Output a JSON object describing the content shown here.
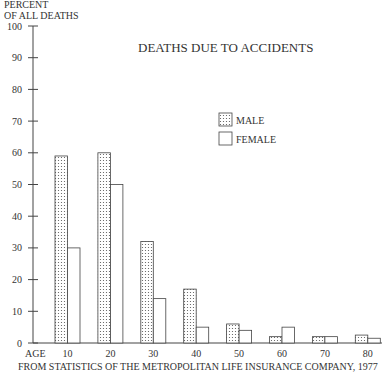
{
  "chart_data": {
    "type": "bar",
    "title": "DEATHS DUE TO ACCIDENTS",
    "ylabel_line1": "PERCENT",
    "ylabel_line2": "OF ALL DEATHS",
    "xlabel": "AGE",
    "source": "FROM STATISTICS OF THE METROPOLITAN LIFE INSURANCE COMPANY, 1977",
    "categories": [
      "10",
      "20",
      "30",
      "40",
      "50",
      "60",
      "70",
      "80"
    ],
    "series": [
      {
        "name": "MALE",
        "pattern": "dotted",
        "values": [
          59,
          60,
          32,
          17,
          6,
          2,
          2,
          2.5
        ]
      },
      {
        "name": "FEMALE",
        "pattern": "blank",
        "values": [
          30,
          50,
          14,
          5,
          4,
          5,
          2,
          1.5
        ]
      }
    ],
    "yticks": [
      0,
      10,
      20,
      30,
      40,
      50,
      60,
      70,
      80,
      90,
      100
    ],
    "ylim": [
      0,
      100
    ],
    "grid": false,
    "legend_position": "upper-right"
  }
}
